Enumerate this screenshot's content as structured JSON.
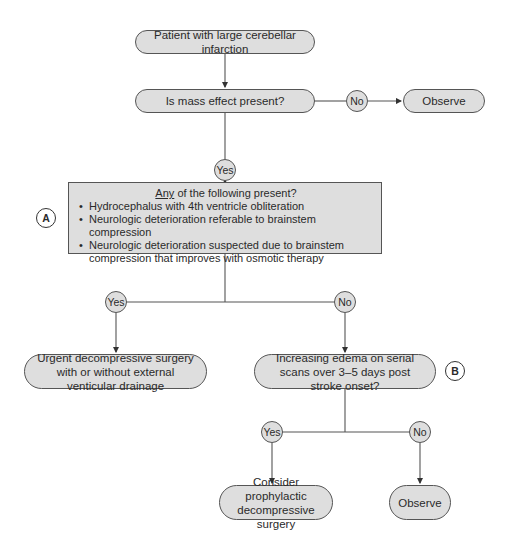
{
  "nodes": {
    "start": "Patient with large cerebellar infarction",
    "mass_effect": "Is mass effect present?",
    "observe_1": "Observe",
    "criteria_box": {
      "title_underlined": "Any",
      "title_rest": " of the following present?",
      "items": [
        "Hydrocephalus with 4th ventricle obliteration",
        "Neurologic deterioration referable to brainstem compression",
        "Neurologic deterioration suspected due to brainstem compression that improves with osmotic therapy"
      ]
    },
    "urgent_surgery": "Urgent decompressive surgery with or without external venticular drainage",
    "increasing_edema": "Increasing edema on serial scans over 3–5 days post stroke onset?",
    "prophylactic": "Consider prophylactic decompressive surgery",
    "observe_2": "Observe"
  },
  "decisions": {
    "no_1": "No",
    "yes_1": "Yes",
    "yes_2": "Yes",
    "no_2": "No",
    "yes_3": "Yes",
    "no_3": "No"
  },
  "markers": {
    "a": "A",
    "b": "B"
  },
  "colors": {
    "node_fill": "#dedede",
    "stroke": "#555555",
    "background": "#ffffff"
  }
}
